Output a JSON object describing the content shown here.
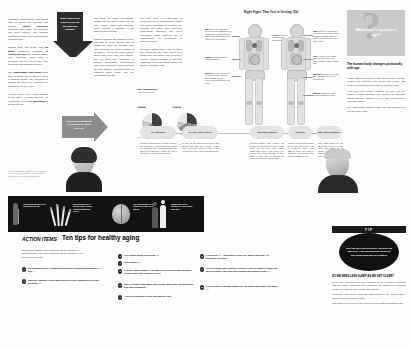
{
  "poster": {
    "anatomy_title": "Eight Signs That You're Getting Old",
    "left_column_1": [
      "Laboratory studies show that cutting back on calories can increase your lifespan. <b>Caloric restriction</b> preserves bone mass, vital functions and brain function, and provides resistance to heat, toxic chemicals and traumatic injury.",
      "Studies show that people who <b>eat meals</b>, particularly breakfast, <b>at regular intervals</b> may prosper longer. Your breakfast eaters have a metabolic rate 3-5 times higher than those who eat breakfast regularly.",
      "The <b>Framingham Heart Study</b> found that exercising 2,000 calories a week in physical activity, the equivalent of walking one hour a day, increases life expectancy by two years.",
      "If active people every known disease of the elderly, it would add only .15 years to the current <b>life expectancy</b> of an 75-year-old."
    ],
    "left_column_2": [
      "The study of aging (gerontology) shows that as people grow old, the body slows, loses less efficiently, which includes a reduction of the ability to fight infection.",
      "Chronic illnesses like diabetes, kidney problems or heart disease tend to disable the elderly by impairing other body functions like blood pressure or circulation. And as the elderly tend to suffer from more than one disease, this can affect their responses to multiple medications. Recuperation from acute illnesses or accidents such as heart attacks, pneumonia and hip fractures takes longer and can incapacitate the aged."
    ],
    "left_column_3": [
      "This may result in a temporary or permanent loss of independence, which can trigger depression or dementia-like behavior. The elderly also experience mood-swing disorders and sleep deprivation. These problems can be misdiagnosed as depression or dementia as well.",
      "Excessive factors and a loss of leisure also impact the way older people seek health care. The elderly may overlook a genuine problem because of long-term conditions, but these health issues can become potentially fatal."
    ],
    "arrow_down_text": "What causes our body to lose its strength and vitality?",
    "arrow_right_text": "What are our prospects for slowing the aging process?",
    "charts": {
      "title": "Daily Composition",
      "subtitle": "Average body weight",
      "source": "Source: Nationwide Health U.S. Inst. Study, 2002",
      "items": [
        {
          "year": "AGE 25",
          "segments": [
            {
              "label": "Muscle",
              "value": 45
            },
            {
              "label": "Fat",
              "value": 20
            },
            {
              "label": "Bone",
              "value": 15
            },
            {
              "label": "Other",
              "value": 20
            }
          ],
          "labels": [
            "45%",
            "20%",
            "15%"
          ]
        },
        {
          "year": "AGE 70",
          "segments": [
            {
              "label": "Muscle",
              "value": 27
            },
            {
              "label": "Fat",
              "value": 40
            },
            {
              "label": "Bone",
              "value": 10
            },
            {
              "label": "Other",
              "value": 23
            }
          ],
          "labels": [
            "27%",
            "40%",
            "10%"
          ]
        }
      ]
    },
    "callouts_left": [
      {
        "label": "Skin",
        "text": "loses cells, less elastic; the underlying fat transfers or is repositioned, creating wrinkles and an thickening of blood flow cause skin color changes."
      },
      {
        "label": "Lungs",
        "text": "Maximum breathing capacity declines."
      },
      {
        "label": "Kidneys",
        "text": "become less efficient at removing waste from the blood. Bladder capacity declines and incontinence can result."
      }
    ],
    "callouts_center": [
      {
        "label": "Hearing",
        "text": "It's difficult hearing higher frequencies."
      }
    ],
    "callouts_right": [
      {
        "label": "Sight",
        "text": "Difficulty in focusing on close objects; decreased ability to adjust to sudden changes; trouble viewing light blue and green colors."
      },
      {
        "label": "Heart",
        "text": "A heart at rest pumps about the same amount of blood; during exercise it pumps less."
      },
      {
        "label": "Body fat",
        "text": "increases until middle age, plateaus until later life, then declines."
      },
      {
        "label": "Muscles",
        "text": "weaken with age unless exercised regularly."
      }
    ],
    "right_panel": {
      "badge_title": "What can I expect as I age?",
      "heading": "The human body changes profoundly with age.",
      "paragraphs": [
        "Muscle mass decreases as body fat increases, the skin wrinkles and becomes thin, bones lose density and people experience hearing, sight and memory loss.",
        "Heart and lung capacity diminish with age, and the immune system becomes less effective at defending against infection, making recovery from illness slower and more difficult.",
        "Still, most adults remain healthy and independent well into their later years."
      ]
    },
    "timeline": [
      {
        "pill": "The Aging Brain",
        "body": "Though the brain shrinks in weight and size, the brain's ability to process information does not decline with age. Most older adults retain their mental sharpness; it simply may take a little longer to recall names and facts."
      },
      {
        "pill": "The Older Heart & Arteries",
        "body": "By age <b>70</b>, the heart's resting output has dropped about <b>30%</b> from its peak. Arteries stiffen and blood pressure tends to rise, increasing the risk of heart attack and stroke."
      },
      {
        "pill": "Vital Organ Functions",
        "body": "Metering support rates. Smaller and denser lives and the spine gather central bones are less likely. Thus, among middle-aged people, new report is an afflicted and filings problems at early blood a blood page can compute the figures among tissue change cases."
      },
      {
        "pill": "Aging Skin",
        "body": "Wrinkles and age spots appear as the skin loses elasticity and oil production slows. About <b>90%</b> of visible skin aging is caused by sun exposure rather than the passage of time."
      },
      {
        "pill": "Bone, Muscle & Balance",
        "body": "Bone mass peaks near age <b>30</b> and then declines. After <b>50</b>, adults lose roughly <b>1%</b> of muscle strength per year, which raises the risk of falls and fractures."
      }
    ],
    "facts": [
      {
        "icon": "cane-icon",
        "text": "Arthritis affects 50% of all Americans over 65."
      },
      {
        "icon": "cigarettes-icon",
        "text": "Oral problems are a leading cause of poor nutrition among the elderly."
      },
      {
        "icon": "brain-icon",
        "text": "The brain shrinks by 10% between the ages of 30 and 90."
      },
      {
        "icon": "people-icon",
        "text": "Women will live on average 5.4 years longer than men."
      },
      {
        "icon": "stats-icon",
        "text": "35% of seniors receive some long-term care assistance."
      }
    ],
    "action": {
      "label": "ACTION ITEMS",
      "title": "Ten tips for healthy aging",
      "intro": "No known substance can extend life, but the chances of staying healthy and living a long time can be improved. Here are ten ways to help.",
      "tips_left": [
        {
          "num": "1",
          "text": "Eat a balanced diet, including 5 helpings of fruits and vegetables a day",
          "ref": "(1)."
        },
        {
          "num": "2",
          "text": "Exercise regularly (check with a doctor before starting an exercise program)",
          "ref": "(2)."
        }
      ],
      "tips_right": [
        {
          "num": "3",
          "text": "Get regular health check-ups",
          "ref": "(3)."
        },
        {
          "num": "4",
          "text": "Don't smoke",
          "ref": "(4).",
          " suffix": "It's never too late to quit."
        },
        {
          "num": "5",
          "text": "Practice safety habits",
          "ref": "(5)",
          "suffix": "at home to prevent falls and fractures. Always wear your seatbelt in a car."
        },
        {
          "num": "6",
          "text": "Stay in contact with family and friends. Stay active through work, play and community."
        },
        {
          "num": "7",
          "text": "Avoid overexposure to the sun and the cold."
        },
        {
          "num": "8",
          "text": "If you drink",
          "ref": "(6)",
          "suffix": ", moderation is the key. When you drink, let someone else drive."
        },
        {
          "num": "9",
          "text": "Keep personal and financial records in order to simplify budgeting and investing. Plan long-term housing and money needs",
          "ref": "(7)."
        },
        {
          "num": "10",
          "text": "Keep a positive attitude toward life. Do things that make you happy",
          "ref": "(8)."
        }
      ]
    },
    "tipbox": {
      "bar": "TIP",
      "circle": "Don't nap more than 30 minutes, and don't nap past 3 p.m. A late afternoon nap can disrupt your normal night-time sleep pattern.",
      "heading": "DO WE NEED LESS SLEEP AS WE GET OLDER?",
      "paragraphs": [
        "No. It's likely that at they get older, however, the need for sleep decreases with age. Three underlying sleep disorders that disrupt sleep disorders include sleep apnea and restless leg syndrome.",
        "In addition, older people often take naps during the day, which makes it harder to sleep through the night.",
        "Most adults need seven to nine hours of sleep a night regardless of age."
      ]
    },
    "source_note": "Sources: Nationwide Institute On Aging; National Center for Health Statistics; American Medical Association; World Health Organization."
  }
}
